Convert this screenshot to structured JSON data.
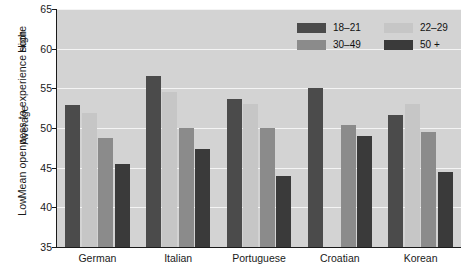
{
  "chart_data": {
    "type": "bar",
    "title": "",
    "xlabel": "",
    "ylabel": "Mean openness to experience score",
    "ylim": [
      35,
      65
    ],
    "yticks": [
      35,
      40,
      45,
      50,
      55,
      60,
      65
    ],
    "grid": true,
    "legend_position": "top-right",
    "qualitative_axis_labels": [
      "Low",
      "Average",
      "High"
    ],
    "categories": [
      "German",
      "Italian",
      "Portuguese",
      "Croatian",
      "Korean"
    ],
    "series": [
      {
        "name": "18–21",
        "color": "#4b4b4b",
        "values": [
          52.9,
          56.5,
          53.6,
          55.1,
          51.6
        ]
      },
      {
        "name": "22–29",
        "color": "#c6c6c6",
        "values": [
          51.9,
          54.5,
          53.0,
          null,
          53.0
        ]
      },
      {
        "name": "30–49",
        "color": "#8b8b8b",
        "values": [
          48.8,
          50.0,
          50.0,
          50.4,
          49.5
        ]
      },
      {
        "name": "50 +",
        "color": "#3a3a3a",
        "values": [
          45.5,
          47.3,
          44.0,
          49.0,
          44.5
        ]
      }
    ]
  },
  "legend": {
    "entries": [
      {
        "label": "18–21"
      },
      {
        "label": "22–29"
      },
      {
        "label": "30–49"
      },
      {
        "label": "50 +"
      }
    ]
  },
  "axis": {
    "y_title": "Mean openness to experience score",
    "qual_high": "High",
    "qual_average": "Average",
    "qual_low": "Low",
    "ticks": [
      "65",
      "60",
      "55",
      "50",
      "45",
      "40",
      "35"
    ]
  },
  "colors": {
    "plot_background": "#d3d3d3",
    "gridline": "#f4f4f4",
    "axis": "#1a1a1a",
    "page_background": "#ffffff"
  }
}
